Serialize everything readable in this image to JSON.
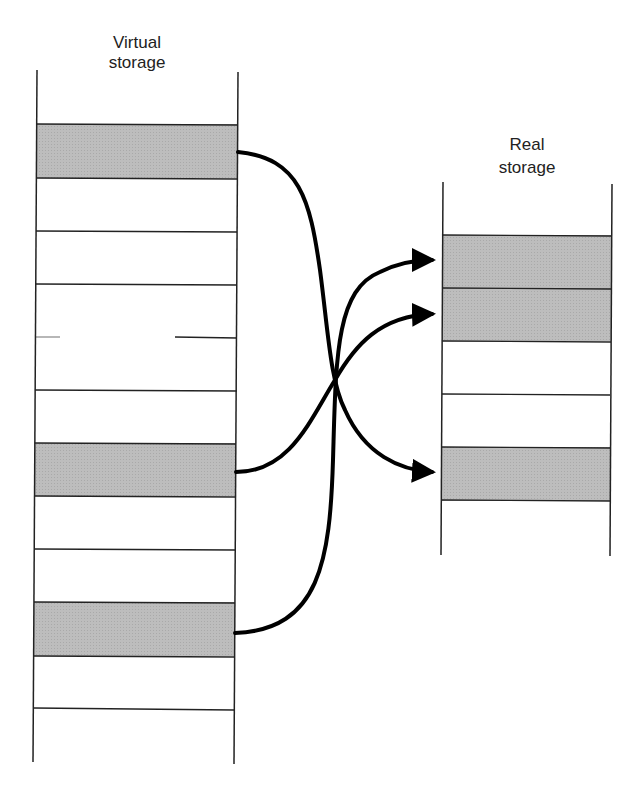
{
  "diagram": {
    "virtual": {
      "title_line1": "Virtual",
      "title_line2": "storage",
      "left_x": 36,
      "right_x": 236,
      "top_y": 70,
      "bottom_y": 762,
      "row_boundaries": [
        124,
        178,
        231,
        284,
        337,
        390,
        443,
        496,
        549,
        602,
        656,
        709
      ],
      "shaded_rows": [
        0,
        6,
        9
      ]
    },
    "real": {
      "title_line1": "Real",
      "title_line2": "storage",
      "left_x": 442,
      "right_x": 611,
      "top_y": 182,
      "bottom_y": 555,
      "row_boundaries": [
        235,
        288,
        341,
        394,
        447,
        500
      ],
      "shaded_rows": [
        0,
        1,
        3
      ]
    },
    "mappings": [
      {
        "from": "virtual-page-1",
        "to": "real-frame-4"
      },
      {
        "from": "virtual-page-7",
        "to": "real-frame-2"
      },
      {
        "from": "virtual-page-10",
        "to": "real-frame-1"
      }
    ],
    "colors": {
      "shade": "#b8b8b8",
      "line": "#222222",
      "arrow": "#000000"
    }
  }
}
